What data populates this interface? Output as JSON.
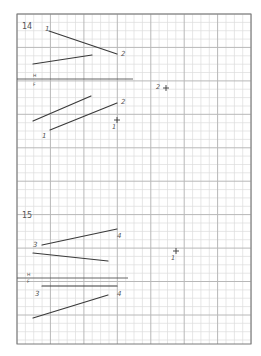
{
  "sheet": {
    "background": "#ffffff",
    "grid": {
      "x0": 17,
      "y0": 14,
      "x1": 251,
      "y1": 344,
      "minor_step": 8.36,
      "major_every": 4,
      "minor_color": "#dcdcdc",
      "major_color": "#b8b8b8",
      "border_color": "#7a7a7a"
    },
    "ink_color": "#3a3a3a",
    "label_color": "#555555"
  },
  "problems": [
    {
      "number": "14",
      "number_pos": [
        22,
        22
      ],
      "fold_line": {
        "x1": 17,
        "y1": 79,
        "x2": 133,
        "y2": 79,
        "upper_label": "H",
        "lower_label": "F",
        "label_x": 33,
        "upper_y": 77,
        "lower_y": 86
      },
      "segments": [
        {
          "name": "top-view-line-1-2",
          "x1": 49,
          "y1": 31,
          "x2": 117,
          "y2": 54
        },
        {
          "name": "top-view-other-line",
          "x1": 33,
          "y1": 64,
          "x2": 92,
          "y2": 55
        },
        {
          "name": "front-view-other-line",
          "x1": 33,
          "y1": 121,
          "x2": 91,
          "y2": 96
        },
        {
          "name": "front-view-line-1-2",
          "x1": 50,
          "y1": 130,
          "x2": 117,
          "y2": 103
        }
      ],
      "labels": [
        {
          "text": "1",
          "x": 45,
          "y": 31
        },
        {
          "text": "2",
          "x": 121,
          "y": 56
        },
        {
          "text": "2",
          "x": 121,
          "y": 104
        },
        {
          "text": "1",
          "x": 42,
          "y": 138
        }
      ],
      "points": [
        {
          "label": "2",
          "cx": 166,
          "cy": 88,
          "label_x": 156,
          "label_y": 89
        },
        {
          "label": "1",
          "cx": 117,
          "cy": 120,
          "label_x": 112,
          "label_y": 129
        }
      ]
    },
    {
      "number": "15",
      "number_pos": [
        22,
        211
      ],
      "fold_line": {
        "x1": 17,
        "y1": 278,
        "x2": 128,
        "y2": 278,
        "upper_label": "H",
        "lower_label": "F",
        "label_x": 27,
        "upper_y": 276,
        "lower_y": 283
      },
      "segments": [
        {
          "name": "top-view-line-3-4",
          "x1": 42,
          "y1": 245,
          "x2": 117,
          "y2": 229
        },
        {
          "name": "top-view-other-line",
          "x1": 33,
          "y1": 253,
          "x2": 108,
          "y2": 261
        },
        {
          "name": "front-view-line-3-4",
          "x1": 42,
          "y1": 286,
          "x2": 117,
          "y2": 286
        },
        {
          "name": "front-view-other-line",
          "x1": 33,
          "y1": 318,
          "x2": 108,
          "y2": 295
        }
      ],
      "labels": [
        {
          "text": "3",
          "x": 33,
          "y": 247
        },
        {
          "text": "4",
          "x": 117,
          "y": 238
        },
        {
          "text": "3",
          "x": 35,
          "y": 296
        },
        {
          "text": "4",
          "x": 117,
          "y": 296
        }
      ],
      "points": [
        {
          "label": "1",
          "cx": 176,
          "cy": 251,
          "label_x": 171,
          "label_y": 260
        }
      ]
    }
  ]
}
